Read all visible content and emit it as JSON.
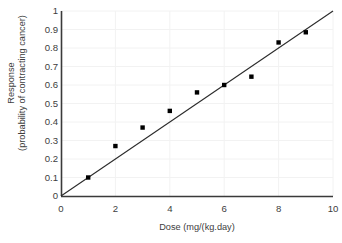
{
  "chart_data": {
    "type": "scatter",
    "title": "",
    "xlabel": "Dose (mg/(kg.day)",
    "ylabel_line1": "Response",
    "ylabel_line2": "(probability of contracting cancer)",
    "x": [
      1,
      2,
      3,
      4,
      5,
      6,
      7,
      8,
      9
    ],
    "values": [
      0.1,
      0.27,
      0.37,
      0.46,
      0.56,
      0.6,
      0.645,
      0.83,
      0.885
    ],
    "series": [
      {
        "name": "Response",
        "x": [
          1,
          2,
          3,
          4,
          5,
          6,
          7,
          8,
          9
        ],
        "values": [
          0.1,
          0.27,
          0.37,
          0.46,
          0.56,
          0.6,
          0.645,
          0.83,
          0.885
        ],
        "marker": "square",
        "color": "#000000"
      },
      {
        "name": "trend-line",
        "type": "line",
        "x": [
          0,
          10
        ],
        "values": [
          0,
          1.0
        ],
        "color": "#2b2b2b"
      }
    ],
    "xlim": [
      0,
      10
    ],
    "ylim": [
      0,
      1
    ],
    "xticks": [
      0,
      2,
      4,
      6,
      8,
      10
    ],
    "xtick_labels": [
      "0",
      "2",
      "4",
      "6",
      "8",
      "10"
    ],
    "yticks": [
      0,
      0.1,
      0.2,
      0.3,
      0.4,
      0.5,
      0.6,
      0.7,
      0.8,
      0.9,
      1
    ],
    "ytick_labels": [
      "0",
      "0.1",
      "0.2",
      "0.3",
      "0.4",
      "0.5",
      "0.6",
      "0.7",
      "0.8",
      "0.9",
      "1"
    ],
    "grid": "horizontal",
    "grid_color": "#f2f2f2",
    "axis_color": "#3a3a3a",
    "legend": "none",
    "background": "#ffffff"
  }
}
